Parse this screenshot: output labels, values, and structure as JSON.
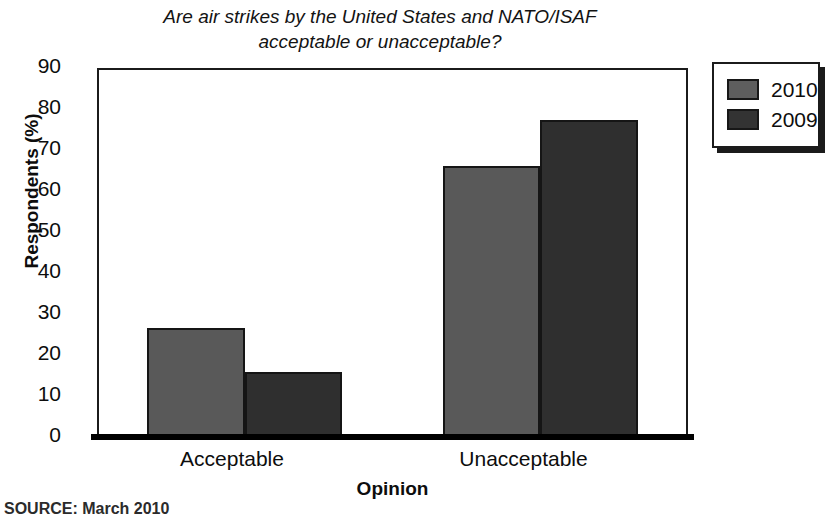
{
  "chart_data": {
    "type": "bar",
    "title": "Are air strikes by the United States and NATO/ISAF\nacceptable or unacceptable?",
    "xlabel": "Opinion",
    "ylabel": "Respondents (%)",
    "categories": [
      "Acceptable",
      "Unacceptable"
    ],
    "series": [
      {
        "name": "2010",
        "color": "#595959",
        "values": [
          26.7,
          66.2
        ]
      },
      {
        "name": "2009",
        "color": "#2f2f2f",
        "values": [
          15.8,
          77.3
        ]
      }
    ],
    "ylim": [
      0,
      90
    ],
    "yticks": [
      0,
      10,
      20,
      30,
      40,
      50,
      60,
      70,
      80,
      90
    ],
    "grid": false,
    "legend_position": "top-right"
  },
  "legend": {
    "entries": [
      {
        "label": "2010",
        "swatch": "legend-swatch-2010"
      },
      {
        "label": "2009",
        "swatch": "legend-swatch-2009"
      }
    ]
  },
  "source": {
    "text": "SOURCE: March 2010"
  }
}
